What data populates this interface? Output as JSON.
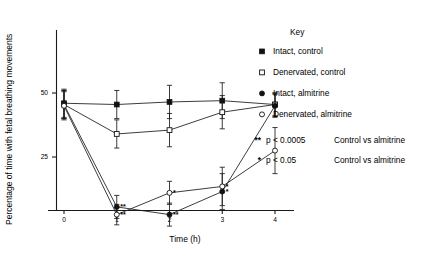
{
  "chart_data": {
    "type": "line",
    "title": "",
    "xlabel": "Time (h)",
    "ylabel": "Percentage of time with fetal breathing movements",
    "x": [
      0,
      1,
      2,
      3,
      4
    ],
    "xticklabels": [
      "0",
      "1",
      "2",
      "3",
      "4"
    ],
    "yticklabels": [
      "25",
      "50"
    ],
    "yticks": [
      25,
      50
    ],
    "xlim": [
      -0.25,
      4.45
    ],
    "ylim": [
      0,
      62
    ],
    "grid": false,
    "legend_position": "right",
    "legend_title": "Key",
    "series": [
      {
        "name": "Intact, control",
        "marker": "filled-square",
        "values": [
          46,
          45.5,
          46.5,
          47,
          45.5
        ],
        "errors": [
          5.5,
          5.5,
          6.5,
          7,
          4.5
        ],
        "significance": [
          "",
          "",
          "",
          "",
          ""
        ]
      },
      {
        "name": "Denervated, control",
        "marker": "open-square",
        "values": [
          45.5,
          34,
          35.5,
          42.5,
          45.5
        ],
        "errors": [
          5.5,
          5.5,
          6.5,
          6.5,
          4.5
        ],
        "significance": [
          "",
          "",
          "",
          "",
          ""
        ]
      },
      {
        "name": "Intact, almitrine",
        "marker": "filled-circle",
        "values": [
          45.5,
          5.5,
          2.5,
          11.5,
          45
        ],
        "errors": [
          5.5,
          4.5,
          4.5,
          7,
          4.5
        ],
        "significance": [
          "",
          "**",
          "**",
          "*",
          ""
        ]
      },
      {
        "name": "Denervated, almitrine",
        "marker": "open-circle",
        "values": [
          45,
          2.5,
          11,
          13.5,
          27.5
        ],
        "errors": [
          5.5,
          4,
          4.5,
          7.5,
          9
        ],
        "significance": [
          "",
          "**",
          "*",
          "*",
          ""
        ]
      }
    ],
    "annotations": [
      {
        "mark": "**",
        "p_value": "p < 0.0005",
        "comparison": "Control vs almitrine"
      },
      {
        "mark": "*",
        "p_value": "p < 0.05",
        "comparison": "Control vs almitrine"
      }
    ]
  }
}
